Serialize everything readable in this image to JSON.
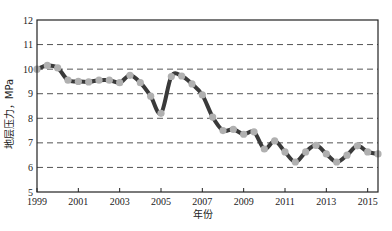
{
  "chart_data": {
    "type": "line",
    "title": "",
    "xlabel": "年份",
    "ylabel": "地层压力，MPa",
    "xlim": [
      1999,
      2015.5
    ],
    "ylim": [
      5,
      12
    ],
    "x_ticks": [
      1999,
      2001,
      2003,
      2005,
      2007,
      2009,
      2011,
      2013,
      2015
    ],
    "y_ticks": [
      5,
      6,
      7,
      8,
      9,
      10,
      11,
      12
    ],
    "grid": {
      "horizontal": true,
      "style": "dashed",
      "vertical": false
    },
    "legend": null,
    "series": [
      {
        "name": "地层压力",
        "line_color": "#3a3a3a",
        "marker_color": "#b0b0b0",
        "x": [
          1999.0,
          1999.5,
          2000.0,
          2000.5,
          2001.0,
          2001.5,
          2002.0,
          2002.5,
          2003.0,
          2003.5,
          2004.0,
          2004.5,
          2005.0,
          2005.5,
          2006.0,
          2006.5,
          2007.0,
          2007.5,
          2008.0,
          2008.5,
          2009.0,
          2009.5,
          2010.0,
          2010.5,
          2011.0,
          2011.5,
          2012.0,
          2012.5,
          2013.0,
          2013.5,
          2014.0,
          2014.5,
          2015.0,
          2015.5
        ],
        "values": [
          10.0,
          10.15,
          10.05,
          9.55,
          9.5,
          9.48,
          9.55,
          9.55,
          9.45,
          9.75,
          9.45,
          8.9,
          8.2,
          9.7,
          9.72,
          9.4,
          8.95,
          8.05,
          7.5,
          7.55,
          7.35,
          7.45,
          6.75,
          7.08,
          6.63,
          6.22,
          6.63,
          6.9,
          6.55,
          6.22,
          6.5,
          6.88,
          6.63,
          6.55
        ]
      }
    ]
  }
}
